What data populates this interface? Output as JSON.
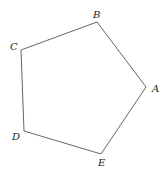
{
  "diagram": {
    "type": "regular-pentagon",
    "stroke_color": "#555555",
    "label_color": "#222222",
    "background": "#ffffff",
    "vertices": [
      {
        "name": "A",
        "x": 146,
        "y": 87,
        "label_x": 152,
        "label_y": 92
      },
      {
        "name": "B",
        "x": 97,
        "y": 22,
        "label_x": 93,
        "label_y": 18
      },
      {
        "name": "C",
        "x": 21,
        "y": 50,
        "label_x": 10,
        "label_y": 50
      },
      {
        "name": "D",
        "x": 24,
        "y": 131,
        "label_x": 12,
        "label_y": 140
      },
      {
        "name": "E",
        "x": 101,
        "y": 154,
        "label_x": 98,
        "label_y": 166
      }
    ],
    "edges": [
      [
        "B",
        "A"
      ],
      [
        "C",
        "B"
      ],
      [
        "D",
        "C"
      ],
      [
        "E",
        "D"
      ],
      [
        "A",
        "E"
      ]
    ]
  }
}
